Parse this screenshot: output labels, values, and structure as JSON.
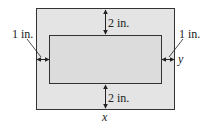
{
  "diagram": {
    "colors": {
      "page_fill": "#e4e4e4",
      "inner_fill": "#dcdcdc",
      "stroke": "#333333",
      "background": "#ffffff"
    },
    "labels": {
      "top_margin": "2 in.",
      "bottom_margin": "2 in.",
      "left_margin": "1 in.",
      "right_margin": "1 in.",
      "width_var": "x",
      "height_var": "y"
    }
  }
}
